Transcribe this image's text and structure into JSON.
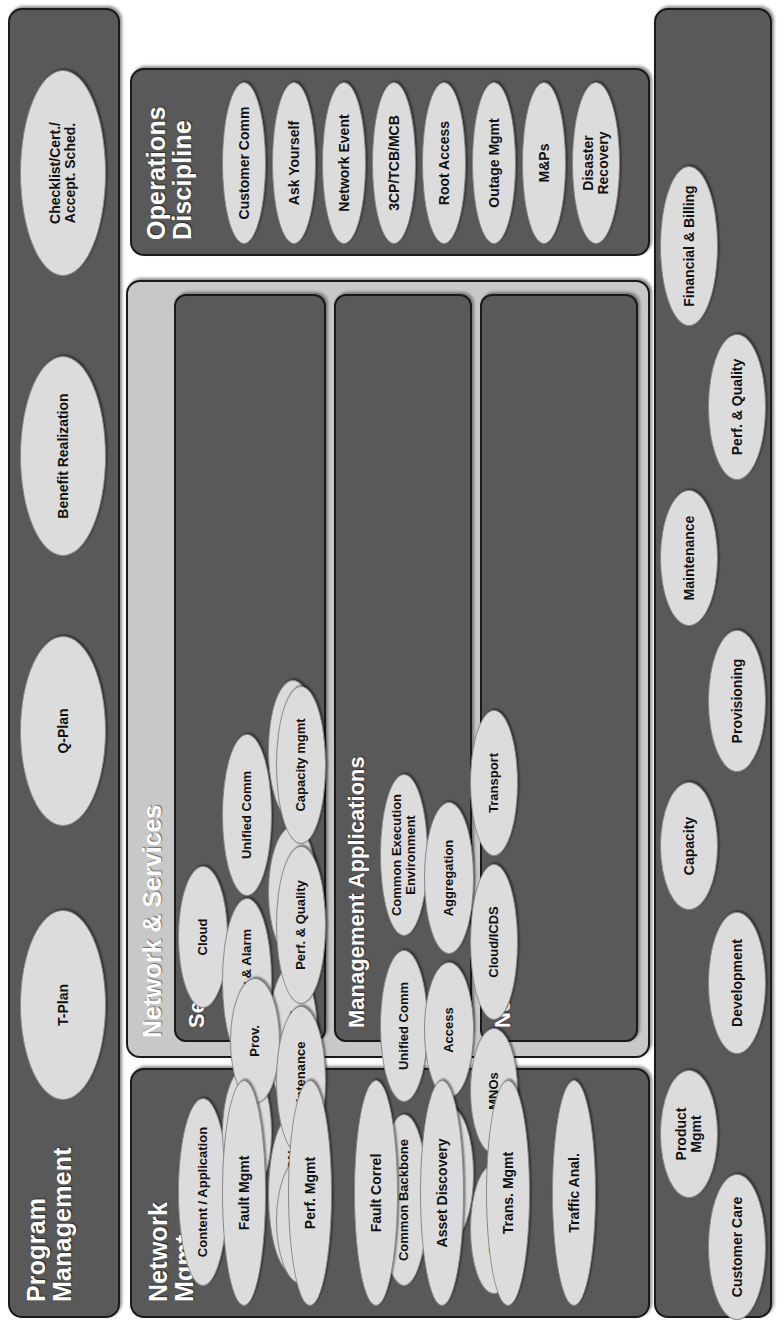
{
  "diagram": {
    "colors": {
      "panel_fill": "#595959",
      "panel_border": "#1a1a1a",
      "node_fill": "#dcdcdc",
      "container_fill": "#c8c8c8",
      "title_text": "#ffffff",
      "node_text": "#111111",
      "page_background": "#ffffff"
    }
  },
  "sections": {
    "process": {
      "title": "Process",
      "nodes_upper": [
        "Product\nMgmt",
        "Capacity",
        "Maintenance",
        "Financial & Billing"
      ],
      "nodes_lower": [
        "Customer Care",
        "Development",
        "Provisioning",
        "Perf. & Quality"
      ]
    },
    "operations_discipline": {
      "title": "Operations\nDiscipline",
      "nodes": [
        "Customer Comm",
        "Ask Yourself",
        "Network Event",
        "3CP/TCB/MCB",
        "Root Access",
        "Outage Mgmt",
        "M&Ps",
        "Disaster\nRecovery"
      ]
    },
    "network_and_services": {
      "title": "Network & Services",
      "services": {
        "title": "Services",
        "row1": [
          "Content / Application",
          "Cloud"
        ],
        "row2": [
          "Data",
          "Security & Alarm",
          "Unified Comm"
        ],
        "row3": [
          "Storage / CDN",
          "Wireless",
          "IPTV",
          "Wireline"
        ]
      },
      "management_applications": {
        "title": "Management Applications",
        "row1": [
          "Prov."
        ],
        "row2": [
          "Care",
          "Maintenance",
          "Perf. & Quality",
          "Capacity mgmt"
        ]
      },
      "network": {
        "title": "Network",
        "row1": [
          "Common Backbone",
          "Unified Comm",
          "Common Execution\nEnvironment"
        ],
        "row2": [
          "Regional",
          "Access",
          "Aggregation"
        ],
        "row3": [
          "Security",
          "MNOs",
          "Cloud/ICDS",
          "Transport"
        ]
      }
    },
    "network_mgmt": {
      "title": "Network\nMgmt",
      "nodes": [
        "Fault Mgmt",
        "Perf. Mgmt",
        "Fault Correl",
        "Asset Discovery",
        "Trans. Mgmt",
        "Traffic Anal."
      ]
    },
    "program_management": {
      "title": "Program\nManagement",
      "nodes": [
        "T-Plan",
        "Q-Plan",
        "Benefit Realization",
        "Checklist/Cert./\nAccept. Sched."
      ]
    }
  }
}
